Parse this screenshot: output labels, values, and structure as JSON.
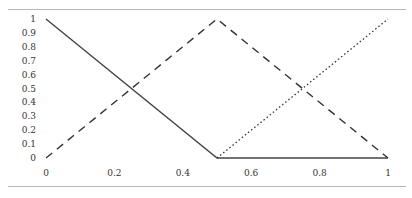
{
  "chart_data": {
    "type": "line",
    "title": "",
    "xlabel": "",
    "ylabel": "",
    "xlim": [
      0,
      1
    ],
    "ylim": [
      0,
      1
    ],
    "grid": false,
    "legend": null,
    "x_ticks": [
      "0",
      "0.2",
      "0.4",
      "0.6",
      "0.8",
      "1"
    ],
    "y_ticks": [
      "0",
      "0.1",
      "0.2",
      "0.3",
      "0.4",
      "0.5",
      "0.6",
      "0.7",
      "0.8",
      "0.9",
      "1"
    ],
    "series": [
      {
        "name": "solid",
        "style": "solid",
        "x": [
          0,
          0.5,
          1
        ],
        "y": [
          1,
          0,
          0
        ]
      },
      {
        "name": "dashed",
        "style": "dashed",
        "x": [
          0,
          0.5,
          1
        ],
        "y": [
          0,
          1,
          0
        ]
      },
      {
        "name": "dotted",
        "style": "dotted",
        "x": [
          0.5,
          1
        ],
        "y": [
          0,
          1
        ]
      }
    ]
  }
}
